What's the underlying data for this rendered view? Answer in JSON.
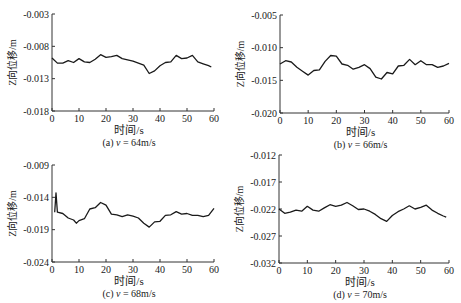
{
  "chart_data": [
    {
      "id": "a",
      "type": "line",
      "caption": "(a) v = 64m/s",
      "caption_prefix": "(a) ",
      "caption_var": "v",
      "caption_suffix": " = 64m/s",
      "xlabel": "时间/s",
      "ylabel": "Z向位移/m",
      "xlim": [
        0,
        60
      ],
      "ylim": [
        -0.018,
        -0.003
      ],
      "xticks": [
        0,
        10,
        20,
        30,
        40,
        50,
        60
      ],
      "yticks": [
        -0.018,
        -0.013,
        -0.008,
        -0.003
      ],
      "ytick_labels": [
        "-0.018",
        "-0.013",
        "-0.008",
        "-0.003"
      ],
      "grid": false,
      "x": [
        0,
        2,
        4,
        6,
        8,
        10,
        12,
        14,
        16,
        18,
        20,
        22,
        24,
        26,
        28,
        30,
        32,
        34,
        36,
        38,
        40,
        42,
        44,
        46,
        48,
        50,
        52,
        54,
        56,
        58,
        59
      ],
      "values": [
        -0.0098,
        -0.0106,
        -0.0106,
        -0.0102,
        -0.0105,
        -0.0099,
        -0.0104,
        -0.0105,
        -0.01,
        -0.0093,
        -0.0097,
        -0.0096,
        -0.0094,
        -0.0099,
        -0.0101,
        -0.0103,
        -0.0106,
        -0.0109,
        -0.0122,
        -0.0118,
        -0.011,
        -0.0105,
        -0.0104,
        -0.0094,
        -0.0099,
        -0.0098,
        -0.0094,
        -0.0104,
        -0.0107,
        -0.011,
        -0.0112
      ]
    },
    {
      "id": "b",
      "type": "line",
      "caption": "(b) v = 66m/s",
      "caption_prefix": "(b) ",
      "caption_var": "v",
      "caption_suffix": " = 66m/s",
      "xlabel": "时间/s",
      "ylabel": "Z向位移/m",
      "xlim": [
        0,
        60
      ],
      "ylim": [
        -0.02,
        -0.005
      ],
      "xticks": [
        0,
        10,
        20,
        30,
        40,
        50,
        60
      ],
      "yticks": [
        -0.02,
        -0.015,
        -0.01,
        -0.005
      ],
      "ytick_labels": [
        "-0.020",
        "-0.015",
        "-0.010",
        "-0.005"
      ],
      "grid": false,
      "x": [
        0,
        2,
        4,
        6,
        8,
        10,
        12,
        14,
        16,
        18,
        20,
        22,
        24,
        26,
        28,
        30,
        32,
        34,
        36,
        38,
        40,
        42,
        44,
        46,
        48,
        50,
        52,
        54,
        56,
        58,
        60
      ],
      "values": [
        -0.0125,
        -0.012,
        -0.0122,
        -0.013,
        -0.0136,
        -0.0142,
        -0.0135,
        -0.0134,
        -0.0121,
        -0.0112,
        -0.0113,
        -0.0125,
        -0.0127,
        -0.0133,
        -0.013,
        -0.0126,
        -0.0132,
        -0.0145,
        -0.0148,
        -0.0138,
        -0.014,
        -0.0128,
        -0.0127,
        -0.0118,
        -0.0126,
        -0.012,
        -0.0126,
        -0.0126,
        -0.013,
        -0.0128,
        -0.0124
      ]
    },
    {
      "id": "c",
      "type": "line",
      "caption": "(c) v = 68m/s",
      "caption_prefix": "(c) ",
      "caption_var": "v",
      "caption_suffix": " = 68m/s",
      "xlabel": "时间/s",
      "ylabel": "Z向位移/m",
      "xlim": [
        0,
        60
      ],
      "ylim": [
        -0.024,
        -0.009
      ],
      "xticks": [
        0,
        10,
        20,
        30,
        40,
        50,
        60
      ],
      "yticks": [
        -0.024,
        -0.019,
        -0.014,
        -0.009
      ],
      "ytick_labels": [
        "-0.024",
        "-0.019",
        "-0.014",
        "-0.009"
      ],
      "grid": false,
      "x": [
        1,
        1.5,
        2,
        4,
        6,
        8,
        9,
        10,
        12,
        14,
        16,
        18,
        20,
        22,
        24,
        26,
        28,
        30,
        32,
        34,
        36,
        38,
        40,
        42,
        44,
        46,
        48,
        50,
        52,
        54,
        56,
        58,
        60
      ],
      "values": [
        -0.0163,
        -0.0133,
        -0.0163,
        -0.0165,
        -0.0172,
        -0.0175,
        -0.018,
        -0.0176,
        -0.0173,
        -0.0158,
        -0.0156,
        -0.0148,
        -0.0152,
        -0.0166,
        -0.0167,
        -0.017,
        -0.0167,
        -0.0169,
        -0.0172,
        -0.018,
        -0.0186,
        -0.0178,
        -0.0177,
        -0.0168,
        -0.0167,
        -0.0162,
        -0.0166,
        -0.0165,
        -0.0168,
        -0.0168,
        -0.017,
        -0.0168,
        -0.0157
      ]
    },
    {
      "id": "d",
      "type": "line",
      "caption": "(d) v = 70m/s",
      "caption_prefix": "(d) ",
      "caption_var": "v",
      "caption_suffix": " = 70m/s",
      "xlabel": "时间/s",
      "ylabel": "Z向位移/m",
      "xlim": [
        0,
        60
      ],
      "ylim": [
        -0.032,
        -0.012
      ],
      "xticks": [
        0,
        10,
        20,
        30,
        40,
        50,
        60
      ],
      "yticks": [
        -0.032,
        -0.027,
        -0.022,
        -0.017,
        -0.012
      ],
      "ytick_labels": [
        "-0.032",
        "-0.027",
        "-0.022",
        "-0.017",
        "-0.012"
      ],
      "grid": false,
      "x": [
        0,
        2,
        4,
        6,
        8,
        10,
        12,
        14,
        16,
        18,
        20,
        22,
        24,
        26,
        28,
        30,
        32,
        34,
        36,
        38,
        40,
        42,
        44,
        46,
        48,
        50,
        52,
        54,
        56,
        58,
        59
      ],
      "values": [
        -0.022,
        -0.0228,
        -0.0226,
        -0.0222,
        -0.0224,
        -0.0215,
        -0.0222,
        -0.0224,
        -0.0218,
        -0.0212,
        -0.0215,
        -0.0213,
        -0.0208,
        -0.0214,
        -0.0221,
        -0.022,
        -0.0224,
        -0.023,
        -0.0238,
        -0.0243,
        -0.0232,
        -0.0225,
        -0.022,
        -0.0214,
        -0.022,
        -0.0217,
        -0.0213,
        -0.0222,
        -0.0228,
        -0.0233,
        -0.0235
      ]
    }
  ],
  "panels": [
    {
      "x": 52,
      "y": 14,
      "w": 162,
      "h": 97
    },
    {
      "x": 280,
      "y": 15,
      "w": 169,
      "h": 98
    },
    {
      "x": 52,
      "y": 165,
      "w": 162,
      "h": 97
    },
    {
      "x": 279,
      "y": 155,
      "w": 170,
      "h": 108
    }
  ],
  "style": {
    "line_color": "#1a1a1a",
    "axis_color": "#333333",
    "background": "#ffffff"
  }
}
